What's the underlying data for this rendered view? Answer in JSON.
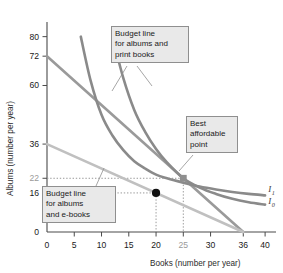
{
  "chart_data": {
    "type": "line",
    "title": "",
    "xlabel": "Books (number per year)",
    "ylabel": "Albums (number per year)",
    "xlim": [
      0,
      42
    ],
    "ylim": [
      0,
      86
    ],
    "grid": false,
    "legend_position": "inline-right",
    "x_ticks": [
      {
        "value": 0,
        "label": "0",
        "muted": false
      },
      {
        "value": 5,
        "label": "5",
        "muted": false
      },
      {
        "value": 10,
        "label": "10",
        "muted": false
      },
      {
        "value": 15,
        "label": "15",
        "muted": false
      },
      {
        "value": 20,
        "label": "20",
        "muted": false
      },
      {
        "value": 25,
        "label": "25",
        "muted": true
      },
      {
        "value": 30,
        "label": "30",
        "muted": false
      },
      {
        "value": 36,
        "label": "36",
        "muted": false
      },
      {
        "value": 40,
        "label": "40",
        "muted": false
      }
    ],
    "y_ticks": [
      {
        "value": 0,
        "label": "0",
        "muted": false
      },
      {
        "value": 16,
        "label": "16",
        "muted": false
      },
      {
        "value": 22,
        "label": "22",
        "muted": true
      },
      {
        "value": 36,
        "label": "36",
        "muted": false
      },
      {
        "value": 60,
        "label": "60",
        "muted": false
      },
      {
        "value": 72,
        "label": "72",
        "muted": false
      },
      {
        "value": 80,
        "label": "80",
        "muted": false
      }
    ],
    "series": [
      {
        "name": "Budget line for albums and print books",
        "role": "budget-line-print-books",
        "color": "#9a9a9a",
        "kind": "straight",
        "points": [
          [
            0,
            72
          ],
          [
            36,
            0
          ]
        ]
      },
      {
        "name": "Budget line for albums and e-books",
        "role": "budget-line-ebooks",
        "color": "#c0c0c0",
        "kind": "straight",
        "points": [
          [
            0,
            36
          ],
          [
            36,
            0
          ]
        ]
      },
      {
        "name": "I1",
        "role": "indifference-curve-high",
        "color": "#8a8a8a",
        "kind": "curve",
        "points": [
          [
            6.2,
            80
          ],
          [
            8,
            62
          ],
          [
            10,
            48
          ],
          [
            12,
            39.5
          ],
          [
            14,
            33.5
          ],
          [
            16,
            29
          ],
          [
            18,
            26
          ],
          [
            20,
            23.5
          ],
          [
            22,
            22
          ],
          [
            25,
            20.2
          ],
          [
            28,
            18.6
          ],
          [
            31,
            17.4
          ],
          [
            34,
            16.4
          ],
          [
            37,
            15.6
          ],
          [
            40,
            15.0
          ]
        ]
      },
      {
        "name": "I0",
        "role": "indifference-curve-low",
        "color": "#8a8a8a",
        "kind": "curve",
        "points": [
          [
            12,
            80
          ],
          [
            14,
            63
          ],
          [
            16,
            50
          ],
          [
            18,
            41
          ],
          [
            20,
            34
          ],
          [
            22,
            28.5
          ],
          [
            25,
            22
          ],
          [
            28,
            18.2
          ],
          [
            31,
            15.6
          ],
          [
            34,
            13.6
          ],
          [
            37,
            12.2
          ],
          [
            40,
            11.2
          ]
        ]
      }
    ],
    "markers": [
      {
        "name": "best-affordable-point",
        "x": 20,
        "y": 16,
        "shape": "circle",
        "color": "#111111",
        "guide_lines": true
      },
      {
        "name": "tangency-point-i1",
        "x": 25,
        "y": 22,
        "shape": "square",
        "color": "#8f8f8f",
        "guide_lines": true
      }
    ],
    "curve_labels": [
      {
        "name": "I1",
        "base": "I",
        "sub": "1",
        "x": 40.6,
        "y": 16.2
      },
      {
        "name": "I0",
        "base": "I",
        "sub": "0",
        "x": 40.6,
        "y": 11.4
      }
    ],
    "annotations": [
      {
        "name": "callout-print-books",
        "text": "Budget line\nfor albums and\nprint books"
      },
      {
        "name": "callout-best-point",
        "text": "Best\naffordable\npoint"
      },
      {
        "name": "callout-ebooks",
        "text": "Budget line\nfor albums\nand e-books"
      }
    ]
  }
}
